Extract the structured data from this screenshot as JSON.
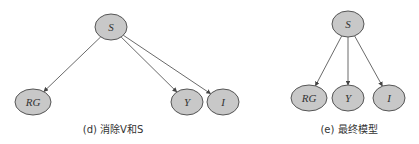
{
  "diagrams": [
    {
      "caption": "(d) 消除V和S",
      "nodes": [
        {
          "id": "S",
          "label": "S",
          "x": 111,
          "y": 27,
          "rx": 16,
          "ry": 13
        },
        {
          "id": "RG",
          "label": "RG",
          "x": 33,
          "y": 102,
          "rx": 18,
          "ry": 13
        },
        {
          "id": "Y",
          "label": "Y",
          "x": 187,
          "y": 102,
          "rx": 16,
          "ry": 13
        },
        {
          "id": "I",
          "label": "I",
          "x": 223,
          "y": 102,
          "rx": 16,
          "ry": 13
        }
      ],
      "edges": [
        {
          "from": "S",
          "to": "RG"
        },
        {
          "from": "S",
          "to": "Y"
        },
        {
          "from": "S",
          "to": "I"
        }
      ]
    },
    {
      "caption": "(e) 最终模型",
      "nodes": [
        {
          "id": "S",
          "label": "S",
          "x": 348,
          "y": 24,
          "rx": 16,
          "ry": 13
        },
        {
          "id": "RG",
          "label": "RG",
          "x": 309,
          "y": 98,
          "rx": 18,
          "ry": 13
        },
        {
          "id": "Y",
          "label": "Y",
          "x": 348,
          "y": 98,
          "rx": 16,
          "ry": 13
        },
        {
          "id": "I",
          "label": "I",
          "x": 389,
          "y": 98,
          "rx": 16,
          "ry": 13
        }
      ],
      "edges": [
        {
          "from": "S",
          "to": "RG"
        },
        {
          "from": "S",
          "to": "Y"
        },
        {
          "from": "S",
          "to": "I"
        }
      ]
    }
  ]
}
